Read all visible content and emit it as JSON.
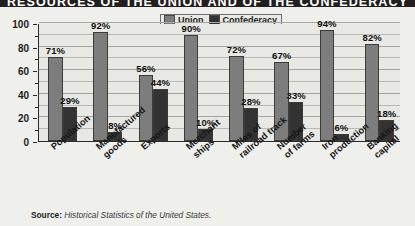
{
  "title": "RESOURCES OF THE UNION AND OF THE CONFEDERACY",
  "source": {
    "label": "Source:",
    "text": "Historical Statistics of the United States."
  },
  "legend": {
    "position": "top-center",
    "items": [
      {
        "label": "Union",
        "color": "#7d7d7d"
      },
      {
        "label": "Confederacy",
        "color": "#333333"
      }
    ]
  },
  "axis": {
    "y_ticks": [
      "0",
      "20",
      "40",
      "60",
      "80",
      "100"
    ],
    "y_minor_step": 10
  },
  "chart_data": {
    "type": "bar",
    "title": "RESOURCES OF THE UNION AND OF THE CONFEDERACY",
    "xlabel": "",
    "ylabel": "",
    "ylim": [
      0,
      100
    ],
    "grid": true,
    "legend_position": "top-center",
    "categories": [
      "Population",
      "Manufactured goods",
      "Exports",
      "Merchant ships",
      "Miles of railroad track",
      "Number of farms",
      "Iron production",
      "Banking capital"
    ],
    "category_lines": [
      [
        "Population"
      ],
      [
        "Manufactured",
        "goods"
      ],
      [
        "Exports"
      ],
      [
        "Merchant",
        "ships"
      ],
      [
        "Miles of",
        "railroad track"
      ],
      [
        "Number",
        "of farms"
      ],
      [
        "Iron",
        "production"
      ],
      [
        "Banking",
        "capital"
      ]
    ],
    "series": [
      {
        "name": "Union",
        "color": "#7d7d7d",
        "values": [
          71,
          92,
          56,
          90,
          72,
          67,
          94,
          82
        ],
        "labels": [
          "71%",
          "92%",
          "56%",
          "90%",
          "72%",
          "67%",
          "94%",
          "82%"
        ]
      },
      {
        "name": "Confederacy",
        "color": "#333333",
        "values": [
          29,
          8,
          44,
          10,
          28,
          33,
          6,
          18
        ],
        "labels": [
          "29%",
          "8%",
          "44%",
          "10%",
          "28%",
          "33%",
          "6%",
          "18%"
        ]
      }
    ]
  }
}
